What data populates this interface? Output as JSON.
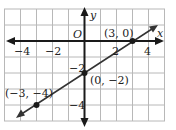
{
  "diagram": {
    "type": "coordinate-plane-line",
    "axes": {
      "x_label": "x",
      "y_label": "y",
      "origin_label": "O"
    },
    "x_ticks": [
      {
        "value": -4,
        "label": "−4"
      },
      {
        "value": -2,
        "label": "−2"
      },
      {
        "value": 2,
        "label": "2"
      },
      {
        "value": 4,
        "label": "4"
      }
    ],
    "y_ticks": [
      {
        "value": -2,
        "label": "−2"
      },
      {
        "value": -4,
        "label": "−4"
      }
    ],
    "points": [
      {
        "x": 3,
        "y": 0,
        "label": "(3, 0)"
      },
      {
        "x": 0,
        "y": -2,
        "label": "(0, −2)"
      },
      {
        "x": -3,
        "y": -4,
        "label": "(−3, −4)"
      }
    ],
    "grid": {
      "x_range": [
        -5,
        5
      ],
      "y_range": [
        -5,
        2
      ]
    },
    "colors": {
      "grid": "#b8b8b8",
      "axis": "#1a1a1a",
      "line": "#333333"
    }
  }
}
